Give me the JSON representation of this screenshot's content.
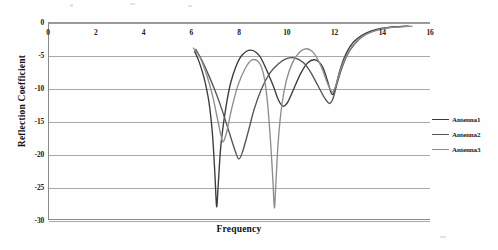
{
  "chart_data": {
    "type": "line",
    "title": "",
    "xlabel": "Frequency",
    "ylabel": "Reflection Coefficient",
    "xlim": [
      0,
      16
    ],
    "ylim": [
      -30,
      0
    ],
    "xticks": [
      0,
      2,
      4,
      6,
      8,
      10,
      12,
      14,
      16
    ],
    "yticks": [
      0,
      -5,
      -10,
      -15,
      -20,
      -25,
      -30
    ],
    "grid": true,
    "legend_position": "right",
    "series": [
      {
        "name": "Antenna1",
        "color": "#3b3b3b",
        "points": [
          [
            6.1,
            -4.3
          ],
          [
            6.3,
            -6.0
          ],
          [
            6.5,
            -8.4
          ],
          [
            6.7,
            -12.0
          ],
          [
            6.85,
            -17.0
          ],
          [
            6.95,
            -23.0
          ],
          [
            7.02,
            -27.8
          ],
          [
            7.08,
            -25.0
          ],
          [
            7.2,
            -18.5
          ],
          [
            7.4,
            -13.0
          ],
          [
            7.6,
            -9.2
          ],
          [
            7.85,
            -6.4
          ],
          [
            8.1,
            -4.8
          ],
          [
            8.45,
            -4.1
          ],
          [
            8.8,
            -4.9
          ],
          [
            9.1,
            -7.0
          ],
          [
            9.4,
            -9.6
          ],
          [
            9.6,
            -11.6
          ],
          [
            9.8,
            -12.6
          ],
          [
            10.0,
            -12.0
          ],
          [
            10.25,
            -10.0
          ],
          [
            10.55,
            -7.6
          ],
          [
            10.85,
            -6.0
          ],
          [
            11.15,
            -5.6
          ],
          [
            11.45,
            -6.6
          ],
          [
            11.65,
            -8.6
          ],
          [
            11.8,
            -10.4
          ],
          [
            11.9,
            -10.8
          ],
          [
            12.0,
            -9.8
          ],
          [
            12.15,
            -7.6
          ],
          [
            12.35,
            -5.4
          ],
          [
            12.6,
            -3.6
          ],
          [
            12.9,
            -2.4
          ],
          [
            13.3,
            -1.5
          ],
          [
            13.8,
            -0.9
          ],
          [
            14.4,
            -0.6
          ],
          [
            15.0,
            -0.5
          ]
        ]
      },
      {
        "name": "Antenna2",
        "color": "#555555",
        "points": [
          [
            6.15,
            -4.0
          ],
          [
            6.4,
            -5.6
          ],
          [
            6.65,
            -7.6
          ],
          [
            6.95,
            -10.2
          ],
          [
            7.25,
            -13.2
          ],
          [
            7.55,
            -16.6
          ],
          [
            7.8,
            -19.4
          ],
          [
            7.95,
            -20.6
          ],
          [
            8.1,
            -19.6
          ],
          [
            8.35,
            -16.4
          ],
          [
            8.6,
            -13.0
          ],
          [
            8.9,
            -10.0
          ],
          [
            9.25,
            -7.6
          ],
          [
            9.6,
            -6.2
          ],
          [
            9.95,
            -5.4
          ],
          [
            10.3,
            -5.3
          ],
          [
            10.65,
            -6.0
          ],
          [
            10.95,
            -7.4
          ],
          [
            11.25,
            -9.4
          ],
          [
            11.55,
            -11.4
          ],
          [
            11.75,
            -12.2
          ],
          [
            11.9,
            -11.4
          ],
          [
            12.05,
            -9.4
          ],
          [
            12.25,
            -7.0
          ],
          [
            12.5,
            -4.8
          ],
          [
            12.8,
            -3.2
          ],
          [
            13.15,
            -2.0
          ],
          [
            13.6,
            -1.2
          ],
          [
            14.2,
            -0.7
          ],
          [
            14.8,
            -0.5
          ],
          [
            15.1,
            -0.5
          ]
        ]
      },
      {
        "name": "Antenna3",
        "color": "#8d8d8d",
        "points": [
          [
            6.05,
            -3.8
          ],
          [
            6.35,
            -5.4
          ],
          [
            6.6,
            -7.8
          ],
          [
            6.85,
            -11.0
          ],
          [
            7.05,
            -14.4
          ],
          [
            7.2,
            -17.0
          ],
          [
            7.3,
            -18.0
          ],
          [
            7.45,
            -16.4
          ],
          [
            7.65,
            -13.0
          ],
          [
            7.9,
            -9.6
          ],
          [
            8.2,
            -7.0
          ],
          [
            8.5,
            -5.6
          ],
          [
            8.8,
            -6.0
          ],
          [
            9.0,
            -8.0
          ],
          [
            9.15,
            -12.0
          ],
          [
            9.28,
            -18.0
          ],
          [
            9.38,
            -24.0
          ],
          [
            9.44,
            -28.0
          ],
          [
            9.5,
            -24.5
          ],
          [
            9.6,
            -18.0
          ],
          [
            9.75,
            -12.5
          ],
          [
            9.95,
            -8.6
          ],
          [
            10.2,
            -6.0
          ],
          [
            10.5,
            -4.4
          ],
          [
            10.8,
            -3.9
          ],
          [
            11.1,
            -4.6
          ],
          [
            11.4,
            -6.6
          ],
          [
            11.65,
            -9.0
          ],
          [
            11.85,
            -10.4
          ],
          [
            12.0,
            -9.6
          ],
          [
            12.2,
            -7.2
          ],
          [
            12.45,
            -5.0
          ],
          [
            12.75,
            -3.3
          ],
          [
            13.1,
            -2.1
          ],
          [
            13.55,
            -1.3
          ],
          [
            14.1,
            -0.8
          ],
          [
            14.7,
            -0.6
          ],
          [
            15.2,
            -0.5
          ]
        ]
      }
    ]
  },
  "axes": {
    "y_title": "Reflection Coefficient",
    "x_title": "Frequency",
    "y_labels": [
      "0",
      "-5",
      "-10",
      "-15",
      "-20",
      "-25",
      "-30"
    ],
    "x_labels": [
      "0",
      "2",
      "4",
      "6",
      "8",
      "10",
      "12",
      "14",
      "16"
    ]
  },
  "legend": {
    "items": [
      {
        "label": "Antenna1",
        "color": "#3b3b3b"
      },
      {
        "label": "Antenna2",
        "color": "#555555"
      },
      {
        "label": "Antenna3",
        "color": "#8d8d8d"
      }
    ]
  }
}
